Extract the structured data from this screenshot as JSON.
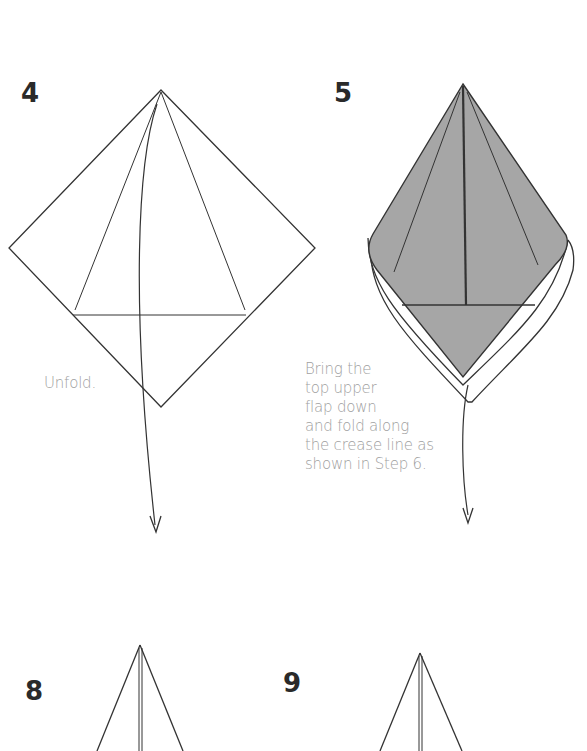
{
  "page": {
    "type": "origami-instructions",
    "steps": [
      {
        "number": "4",
        "caption": "Unfold."
      },
      {
        "number": "5",
        "caption": "Bring the\ntop upper\nflap down\nand fold along\nthe crease line as\nshown in Step 6."
      },
      {
        "number": "8",
        "caption": ""
      },
      {
        "number": "9",
        "caption": ""
      }
    ]
  },
  "colors": {
    "line": "#333333",
    "fill_gray": "#a6a6a6",
    "caption_text": "#a0a0a0",
    "step_number": "#2a2a2a"
  }
}
